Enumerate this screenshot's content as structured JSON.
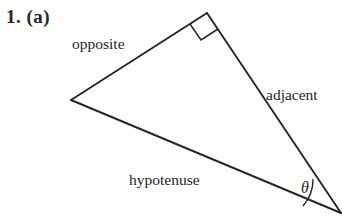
{
  "figure": {
    "problem_number": "1. (a)",
    "labels": {
      "opposite": "opposite",
      "adjacent": "adjacent",
      "hypotenuse": "hypotenuse",
      "angle": "θ"
    },
    "colors": {
      "stroke": "#262626",
      "background": "#fdfdfc",
      "text": "#262626"
    },
    "geometry": {
      "description": "right triangle with right angle at top vertex and angle theta at bottom-right vertex",
      "vertices": {
        "left": [
          71,
          100
        ],
        "top": [
          207,
          13
        ],
        "bottom_right": [
          341,
          213
        ]
      },
      "right_angle_marker_at": "top",
      "angle_arc_at": "bottom_right",
      "sides": {
        "opposite": "left-to-top",
        "adjacent": "top-to-bottom_right",
        "hypotenuse": "left-to-bottom_right"
      }
    }
  }
}
